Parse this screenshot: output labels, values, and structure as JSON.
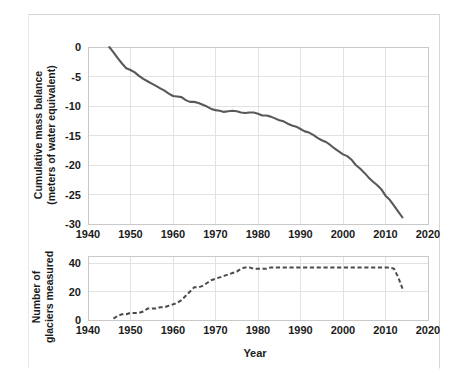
{
  "figure": {
    "xlabel": "Year",
    "background": "#ffffff",
    "line_color": "#59595b",
    "grid_color": "#e2e2e2"
  },
  "chart_data": [
    {
      "type": "line",
      "title": "",
      "panel": "top",
      "xlabel": "Year",
      "ylabel": "Cumulative mass balance\n(meters of water equivalent)",
      "ylabel_line1": "Cumulative mass balance",
      "ylabel_line2": "(meters of water equivalent)",
      "xlim": [
        1940,
        2020
      ],
      "ylim": [
        -30,
        0
      ],
      "xticks": [
        1940,
        1950,
        1960,
        1970,
        1980,
        1990,
        2000,
        2010,
        2020
      ],
      "xticklabels": [
        "1940",
        "1950",
        "1960",
        "1970",
        "1980",
        "1990",
        "2000",
        "2010",
        "2020"
      ],
      "yticks": [
        0,
        -5,
        -10,
        -15,
        -20,
        -25,
        -30
      ],
      "yticklabels": [
        "0",
        "-5",
        "-10",
        "-15",
        "-20",
        "-25",
        "-30"
      ],
      "grid": true,
      "legend": "none",
      "linestyle": "solid",
      "series": [
        {
          "name": "Cumulative mass balance",
          "x": [
            1945,
            1946,
            1947,
            1948,
            1949,
            1950,
            1951,
            1952,
            1953,
            1954,
            1955,
            1956,
            1957,
            1958,
            1959,
            1960,
            1961,
            1962,
            1963,
            1964,
            1965,
            1966,
            1967,
            1968,
            1969,
            1970,
            1971,
            1972,
            1973,
            1974,
            1975,
            1976,
            1977,
            1978,
            1979,
            1980,
            1981,
            1982,
            1983,
            1984,
            1985,
            1986,
            1987,
            1988,
            1989,
            1990,
            1991,
            1992,
            1993,
            1994,
            1995,
            1996,
            1997,
            1998,
            1999,
            2000,
            2001,
            2002,
            2003,
            2004,
            2005,
            2006,
            2007,
            2008,
            2009,
            2010,
            2011,
            2012,
            2013,
            2014
          ],
          "values": [
            0.0,
            -0.9,
            -1.9,
            -2.8,
            -3.6,
            -3.9,
            -4.3,
            -4.9,
            -5.4,
            -5.8,
            -6.2,
            -6.6,
            -7.0,
            -7.4,
            -7.9,
            -8.3,
            -8.4,
            -8.5,
            -9.0,
            -9.3,
            -9.3,
            -9.5,
            -9.8,
            -10.1,
            -10.5,
            -10.7,
            -10.8,
            -11.0,
            -10.9,
            -10.8,
            -10.9,
            -11.1,
            -11.2,
            -11.1,
            -11.1,
            -11.3,
            -11.6,
            -11.6,
            -11.8,
            -12.1,
            -12.4,
            -12.6,
            -13.0,
            -13.3,
            -13.5,
            -13.9,
            -14.3,
            -14.5,
            -14.9,
            -15.4,
            -15.8,
            -16.1,
            -16.6,
            -17.2,
            -17.7,
            -18.2,
            -18.5,
            -19.1,
            -20.0,
            -20.6,
            -21.3,
            -22.1,
            -22.8,
            -23.4,
            -24.1,
            -25.2,
            -25.9,
            -26.9,
            -27.9,
            -28.9
          ]
        }
      ]
    },
    {
      "type": "line",
      "title": "",
      "panel": "bottom",
      "xlabel": "Year",
      "ylabel": "Number of\nglaciers measured",
      "ylabel_line1": "Number of",
      "ylabel_line2": "glaciers measured",
      "xlim": [
        1940,
        2020
      ],
      "ylim": [
        0,
        45
      ],
      "xticks": [
        1940,
        1950,
        1960,
        1970,
        1980,
        1990,
        2000,
        2010,
        2020
      ],
      "xticklabels": [
        "1940",
        "1950",
        "1960",
        "1970",
        "1980",
        "1990",
        "2000",
        "2010",
        "2020"
      ],
      "yticks": [
        0,
        20,
        40
      ],
      "yticklabels": [
        "0",
        "20",
        "40"
      ],
      "grid": true,
      "legend": "none",
      "linestyle": "dashed",
      "series": [
        {
          "name": "Number of glaciers measured",
          "x": [
            1946,
            1947,
            1948,
            1949,
            1950,
            1951,
            1952,
            1953,
            1954,
            1955,
            1956,
            1957,
            1958,
            1959,
            1960,
            1961,
            1962,
            1963,
            1964,
            1965,
            1966,
            1967,
            1968,
            1969,
            1970,
            1971,
            1972,
            1973,
            1974,
            1975,
            1976,
            1977,
            1978,
            1979,
            1980,
            1981,
            1982,
            1983,
            1984,
            1985,
            1986,
            1987,
            1988,
            1989,
            1990,
            1991,
            1992,
            1993,
            1994,
            1995,
            1996,
            1997,
            1998,
            1999,
            2000,
            2001,
            2002,
            2003,
            2004,
            2005,
            2006,
            2007,
            2008,
            2009,
            2010,
            2011,
            2012,
            2013,
            2014
          ],
          "values": [
            1,
            3,
            4,
            4,
            5,
            5,
            5,
            6,
            8,
            8,
            8,
            9,
            9,
            10,
            11,
            12,
            14,
            17,
            20,
            23,
            23,
            24,
            26,
            28,
            29,
            30,
            31,
            32,
            33,
            34,
            36,
            37,
            37,
            36,
            36,
            36,
            36,
            37,
            37,
            37,
            37,
            37,
            37,
            37,
            37,
            37,
            37,
            37,
            37,
            37,
            37,
            37,
            37,
            37,
            37,
            37,
            37,
            37,
            37,
            37,
            37,
            37,
            37,
            37,
            37,
            37,
            36,
            30,
            22
          ]
        }
      ]
    }
  ]
}
